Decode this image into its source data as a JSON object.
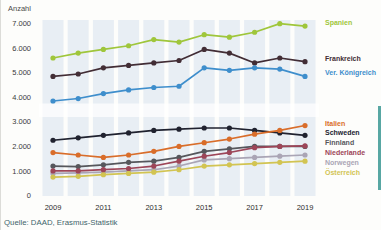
{
  "chart_data": {
    "type": "line",
    "title": "",
    "y_axis_title": "Anzahl",
    "source": "Quelle: DAAD, Erasmus-Statistik",
    "x": [
      2009,
      2010,
      2011,
      2012,
      2013,
      2014,
      2015,
      2016,
      2017,
      2018,
      2019
    ],
    "x_tick_years": [
      2009,
      2011,
      2013,
      2015,
      2017,
      2019
    ],
    "x_tick_labels": [
      "2009",
      "2011",
      "2013",
      "2015",
      "2017",
      "2019"
    ],
    "y_ticks": [
      0,
      1000,
      2000,
      3000,
      4000,
      5000,
      6000,
      7000
    ],
    "y_tick_labels": [
      "0",
      "1.000",
      "2.000",
      "3.000",
      "4.000",
      "5.000",
      "6.000",
      "7.000"
    ],
    "ylim": [
      0,
      7300
    ],
    "grid": "light-blue vertical year bands, no gridlines, no axis lines",
    "legend_position": "right of lines, color-coded text labels",
    "marker": "filled circle on every data point",
    "series": [
      {
        "name": "Spanien",
        "color": "#9fc63b",
        "values": [
          5600,
          5800,
          5950,
          6100,
          6350,
          6250,
          6550,
          6450,
          6650,
          7000,
          6900
        ]
      },
      {
        "name": "Frankreich",
        "color": "#422d35",
        "values": [
          4850,
          4950,
          5200,
          5300,
          5400,
          5500,
          5950,
          5800,
          5400,
          5600,
          5450
        ]
      },
      {
        "name": "Ver. Königreich",
        "color": "#3e8ecc",
        "values": [
          3850,
          3950,
          4150,
          4300,
          4400,
          4450,
          5200,
          5100,
          5200,
          5150,
          4850
        ]
      },
      {
        "name": "Italien",
        "color": "#d96d2a",
        "values": [
          1750,
          1650,
          1550,
          1650,
          1800,
          2000,
          2150,
          2300,
          2500,
          2650,
          2850
        ]
      },
      {
        "name": "Schweden",
        "color": "#20222f",
        "values": [
          2250,
          2350,
          2450,
          2550,
          2650,
          2700,
          2750,
          2750,
          2650,
          2550,
          2450
        ]
      },
      {
        "name": "Finnland",
        "color": "#56575c",
        "values": [
          1200,
          1180,
          1250,
          1350,
          1400,
          1550,
          1800,
          1900,
          2000,
          2000,
          2000
        ]
      },
      {
        "name": "Niederlande",
        "color": "#9d4558",
        "values": [
          1000,
          1000,
          1050,
          1100,
          1200,
          1400,
          1600,
          1750,
          1950,
          2000,
          2020
        ]
      },
      {
        "name": "Norwegen",
        "color": "#aaa5b5",
        "values": [
          900,
          920,
          950,
          1000,
          1050,
          1200,
          1450,
          1500,
          1550,
          1600,
          1650
        ]
      },
      {
        "name": "Österreich",
        "color": "#d2c452",
        "values": [
          750,
          780,
          850,
          900,
          950,
          1050,
          1200,
          1250,
          1300,
          1350,
          1400
        ]
      }
    ],
    "legend_groups": {
      "top": [
        "Spanien",
        "Frankreich",
        "Ver. Königreich"
      ],
      "bottom": [
        "Italien",
        "Schweden",
        "Finnland",
        "Niederlande",
        "Norwegen",
        "Österreich"
      ]
    }
  }
}
